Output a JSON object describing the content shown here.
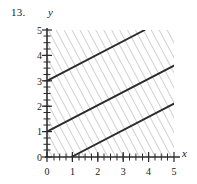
{
  "figure": {
    "problem_number": "13.",
    "x_axis_label": "x",
    "y_axis_label": "y"
  },
  "chart_data": {
    "type": "line",
    "title": "",
    "xlabel": "x",
    "ylabel": "y",
    "xlim": [
      0,
      5.2
    ],
    "ylim": [
      0,
      5
    ],
    "xticks": [
      0,
      1,
      2,
      3,
      4,
      5
    ],
    "yticks": [
      0,
      1,
      2,
      3,
      4,
      5
    ],
    "xtick_labels": [
      "0",
      "1",
      "2",
      "3",
      "4",
      "5"
    ],
    "ytick_labels": [
      "0",
      "1",
      "2",
      "3",
      "4",
      "5"
    ],
    "minor_ticks": true,
    "grid": false,
    "legend": null,
    "shading": {
      "style": "diagonal-hatch",
      "direction": "up-right-45deg",
      "color": "#9a9a9a",
      "covers": "entire-first-quadrant-plot-area"
    },
    "series": [
      {
        "name": "y = 0.5x + 3",
        "slope": 0.5,
        "intercept": 3,
        "points": [
          [
            0,
            3
          ],
          [
            4,
            5
          ]
        ],
        "color": "#2b2b2b"
      },
      {
        "name": "y = 0.5x + 1",
        "slope": 0.5,
        "intercept": 1,
        "points": [
          [
            0,
            1
          ],
          [
            5.2,
            3.6
          ]
        ],
        "color": "#2b2b2b"
      },
      {
        "name": "y = 0.5x - 0.5",
        "slope": 0.5,
        "intercept": -0.5,
        "points": [
          [
            1,
            0
          ],
          [
            5.2,
            2.1
          ]
        ],
        "color": "#2b2b2b"
      }
    ]
  }
}
